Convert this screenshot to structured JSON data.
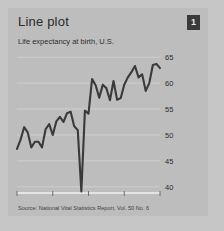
{
  "card": {
    "title": "Line plot",
    "badge": "1",
    "subtitle": "Life expectancy at birth, U.S.",
    "source": "Source:  National Vital Statistics Report, Vol. 50 No. 6"
  },
  "colors": {
    "page_background": "#c6c6c6",
    "card_background": "#bdbdbd",
    "line": "#3a3a3a",
    "gridline": "#cfcfcf",
    "axis": "#e4e4e4",
    "text": "#2e2e2e",
    "badge_background": "#3a3a3a",
    "badge_text": "#e8e8e8"
  },
  "chart_data": {
    "type": "line",
    "title": "Line plot",
    "subtitle": "Life expectancy at birth, U.S.",
    "xlabel": "",
    "ylabel": "",
    "xlim": [
      1900,
      1940
    ],
    "ylim": [
      39,
      66
    ],
    "grid": true,
    "legend": "none",
    "xticks": [
      1900,
      1910,
      1920,
      1930,
      1940
    ],
    "xticklabels": [
      "1900",
      "1910",
      "1920",
      "1930",
      "1940"
    ],
    "yticks": [
      40,
      45,
      50,
      55,
      60,
      65
    ],
    "yticklabels": [
      "40",
      "45",
      "50",
      "55",
      "60",
      "65"
    ],
    "series": [
      {
        "name": "Life expectancy at birth",
        "x": [
          1900,
          1901,
          1902,
          1903,
          1904,
          1905,
          1906,
          1907,
          1908,
          1909,
          1910,
          1911,
          1912,
          1913,
          1914,
          1915,
          1916,
          1917,
          1918,
          1919,
          1920,
          1921,
          1922,
          1923,
          1924,
          1925,
          1926,
          1927,
          1928,
          1929,
          1930,
          1931,
          1932,
          1933,
          1934,
          1935,
          1936,
          1937,
          1938,
          1939,
          1940
        ],
        "values": [
          47.3,
          49.1,
          51.5,
          50.5,
          47.6,
          48.7,
          48.7,
          47.6,
          51.1,
          52.1,
          50.0,
          52.6,
          53.5,
          52.5,
          54.2,
          54.5,
          51.7,
          50.9,
          39.1,
          54.7,
          54.1,
          60.8,
          59.6,
          57.2,
          59.7,
          59.0,
          56.7,
          60.4,
          56.8,
          57.1,
          59.7,
          61.1,
          62.1,
          63.3,
          61.1,
          61.7,
          58.5,
          60.0,
          63.5,
          63.7,
          62.9
        ]
      }
    ],
    "annotations": [
      {
        "x": 1918,
        "y": 39.1,
        "note": "sharp drop (influenza pandemic)"
      }
    ]
  }
}
